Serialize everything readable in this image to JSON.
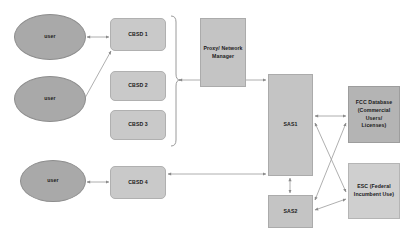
{
  "diagram": {
    "palette": {
      "ellipse_fill": "#a9a9a9",
      "cbsd_fill": "#c9c9c9",
      "proxy_fill": "#c4c4c4",
      "sas_fill": "#c4c4c4",
      "fcc_fill": "#b4b4b4",
      "esc_fill": "#cfcfcf",
      "edge_stroke": "#9a9a9a",
      "background": "#ffffff"
    },
    "nodes": [
      {
        "id": "user1",
        "label": "user",
        "shape": "ellipse",
        "x": 14,
        "y": 14,
        "w": 72,
        "h": 46
      },
      {
        "id": "user2",
        "label": "user",
        "shape": "ellipse",
        "x": 14,
        "y": 76,
        "w": 72,
        "h": 46
      },
      {
        "id": "user3",
        "label": "user",
        "shape": "ellipse",
        "x": 20,
        "y": 160,
        "w": 66,
        "h": 42
      },
      {
        "id": "cbsd1",
        "label": "CBSD 1",
        "shape": "rounded-box",
        "x": 110,
        "y": 18,
        "w": 56,
        "h": 33
      },
      {
        "id": "cbsd2",
        "label": "CBSD 2",
        "shape": "rounded-box",
        "x": 110,
        "y": 71,
        "w": 56,
        "h": 30
      },
      {
        "id": "cbsd3",
        "label": "CBSD 3",
        "shape": "rounded-box",
        "x": 110,
        "y": 110,
        "w": 56,
        "h": 30
      },
      {
        "id": "cbsd4",
        "label": "CBSD 4",
        "shape": "rounded-box",
        "x": 110,
        "y": 166,
        "w": 56,
        "h": 33
      },
      {
        "id": "proxy",
        "label": "Proxy/ Network\nManager",
        "shape": "plain-box",
        "x": 200,
        "y": 18,
        "w": 46,
        "h": 69
      },
      {
        "id": "sas1",
        "label": "SAS1",
        "shape": "plain-box",
        "x": 268,
        "y": 74,
        "w": 45,
        "h": 102
      },
      {
        "id": "sas2",
        "label": "SAS2",
        "shape": "plain-box",
        "x": 268,
        "y": 195,
        "w": 45,
        "h": 33
      },
      {
        "id": "fcc",
        "label": "FCC Database\n(Commercial\nUsers/\nLicenses)",
        "shape": "dark-box",
        "x": 348,
        "y": 86,
        "w": 52,
        "h": 57
      },
      {
        "id": "esc",
        "label": "ESC (Federal\nIncumbent Use)",
        "shape": "esc-box",
        "x": 348,
        "y": 163,
        "w": 52,
        "h": 56
      }
    ],
    "edges": [
      {
        "from": "user1",
        "to": "cbsd1",
        "kind": "bidirectional"
      },
      {
        "from": "user2",
        "to": "cbsd1",
        "kind": "bidirectional-diagonal"
      },
      {
        "from": "user3",
        "to": "cbsd4",
        "kind": "bidirectional"
      },
      {
        "from": "cbsd-bracket",
        "to": "sas1",
        "kind": "bidirectional-through-proxy"
      },
      {
        "from": "cbsd4",
        "to": "sas1",
        "kind": "bidirectional"
      },
      {
        "from": "sas1",
        "to": "sas2",
        "kind": "bidirectional"
      },
      {
        "from": "sas1",
        "to": "fcc",
        "kind": "bidirectional"
      },
      {
        "from": "sas1",
        "to": "esc",
        "kind": "bidirectional-cross"
      },
      {
        "from": "sas2",
        "to": "fcc",
        "kind": "bidirectional-cross"
      },
      {
        "from": "sas2",
        "to": "esc",
        "kind": "bidirectional"
      }
    ],
    "bracket": {
      "label": "",
      "x": 176,
      "y_top": 16,
      "y_bottom": 146
    }
  }
}
